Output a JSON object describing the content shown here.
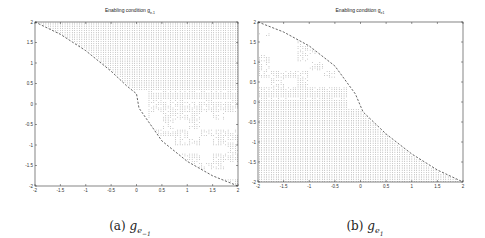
{
  "figure": {
    "panels": [
      {
        "id": "a",
        "title": "Enabling condition g",
        "title_sub": "e-1",
        "caption_prefix": "(a)",
        "caption_symbol": "g",
        "caption_sub": "e",
        "caption_subsub": "−1"
      },
      {
        "id": "b",
        "title": "Enabling condition g",
        "title_sub": "e1",
        "caption_prefix": "(b)",
        "caption_symbol": "g",
        "caption_sub": "e",
        "caption_subsub": "1"
      }
    ]
  },
  "chart_data": [
    {
      "type": "scatter",
      "title": "Enabling condition g_{e-1}",
      "xlabel": "",
      "ylabel": "",
      "xlim": [
        -2,
        2
      ],
      "ylim": [
        -2,
        2
      ],
      "x_ticks": [
        "-2",
        "-1.5",
        "-1",
        "-0.5",
        "0",
        "0.5",
        "1",
        "1.5",
        "2"
      ],
      "y_ticks": [
        "2",
        "1.5",
        "1",
        "0.5",
        "0",
        "-0.5",
        "-1",
        "-1.5",
        "-2"
      ],
      "grid": false,
      "legend": null,
      "series": [
        {
          "name": "enabled region (dots)",
          "description": "Dense dot grid above/right of dashed boundary; dense band for y>0.3, sparse scattered dots for y<0 near x in [0.2,2]"
        },
        {
          "name": "boundary (dashed)",
          "x": [
            -2.0,
            -1.5,
            -1.0,
            -0.5,
            -0.2,
            0.0,
            0.05,
            0.5,
            1.0,
            1.5,
            2.0
          ],
          "y": [
            2.0,
            1.7,
            1.3,
            0.8,
            0.45,
            0.25,
            -0.1,
            -0.9,
            -1.4,
            -1.75,
            -2.0
          ]
        }
      ],
      "caption": "(a) g_{e-1}"
    },
    {
      "type": "scatter",
      "title": "Enabling condition g_{e1}",
      "xlabel": "",
      "ylabel": "",
      "xlim": [
        -2,
        2
      ],
      "ylim": [
        -2,
        2
      ],
      "x_ticks": [
        "-2",
        "-1.5",
        "-1",
        "-0.5",
        "0",
        "0.5",
        "1",
        "1.5",
        "2"
      ],
      "y_ticks": [
        "2",
        "1.5",
        "1",
        "0.5",
        "0",
        "-0.5",
        "-1",
        "-1.5",
        "-2"
      ],
      "grid": false,
      "legend": null,
      "series": [
        {
          "name": "enabled region (dots)",
          "description": "Dense dot grid below/left of dashed boundary for y<0.3; sparse scattered dots for y in [0.3,1.7] near x in [-2,-0.2]"
        },
        {
          "name": "boundary (dashed)",
          "x": [
            -2.0,
            -1.5,
            -1.0,
            -0.5,
            -0.1,
            0.0,
            0.05,
            0.5,
            1.0,
            1.5,
            2.0
          ],
          "y": [
            2.0,
            1.75,
            1.4,
            0.9,
            0.2,
            -0.1,
            -0.25,
            -0.8,
            -1.3,
            -1.7,
            -2.0
          ]
        }
      ],
      "caption": "(b) g_{e1}"
    }
  ]
}
